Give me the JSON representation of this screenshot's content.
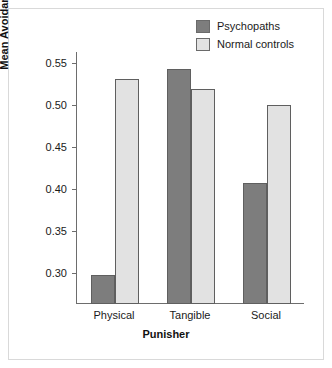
{
  "chart_data": {
    "type": "bar",
    "title": "",
    "subtitle": "",
    "categories": [
      "Physical",
      "Tangible",
      "Social"
    ],
    "series": [
      {
        "name": "Psychopaths",
        "color": "#7d7d7d",
        "values": [
          0.297,
          0.542,
          0.406
        ]
      },
      {
        "name": "Normal controls",
        "color": "#e2e2e2",
        "values": [
          0.53,
          0.518,
          0.499
        ]
      }
    ],
    "xlabel": "Punisher",
    "ylabel": "Mean Avoidance Learning",
    "yticks": [
      "0.55",
      "0.50",
      "0.45",
      "0.40",
      "0.35",
      "0.30"
    ],
    "ytick_values": [
      0.55,
      0.5,
      0.45,
      0.4,
      0.35,
      0.3
    ],
    "ylim": [
      0.2625,
      0.5625
    ],
    "xlim_note": "categorical",
    "grid": false,
    "legend_position": "top-right",
    "orientation": "vertical"
  },
  "legend": {
    "items": [
      {
        "label": "Psychopaths",
        "swatch": "#7d7d7d"
      },
      {
        "label": "Normal controls",
        "swatch": "#e2e2e2"
      }
    ]
  },
  "axes": {
    "x_title": "Punisher",
    "y_title": "Mean Avoidance Learning"
  },
  "colors": {
    "frame": "#d9d9d9",
    "axis": "#6d6d6d",
    "bar_edge": "#5f5f5f",
    "text": "#1a1a1a",
    "background": "#ffffff"
  }
}
